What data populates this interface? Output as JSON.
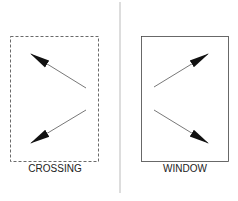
{
  "diagram": {
    "left_panel": {
      "label": "CROSSING",
      "border_style": "dashed"
    },
    "right_panel": {
      "label": "WINDOW",
      "border_style": "solid"
    },
    "colors": {
      "line": "#333333",
      "divider": "#bbbbbb",
      "arrowhead": "#111111"
    }
  }
}
